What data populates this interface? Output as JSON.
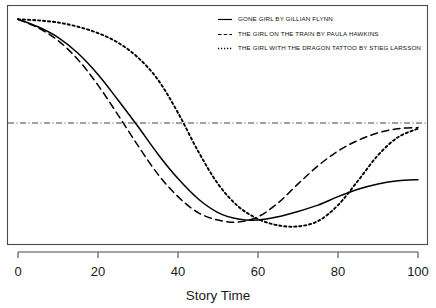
{
  "chart_data": {
    "type": "line",
    "title": "",
    "subtitle": "",
    "xlabel": "Story Time",
    "ylabel": "",
    "xlim": [
      0,
      100
    ],
    "ylim": [
      -1.05,
      1.05
    ],
    "xticks": [
      "0",
      "20",
      "40",
      "60",
      "80",
      "100"
    ],
    "xtick_values": [
      0,
      20,
      40,
      60,
      80,
      100
    ],
    "yticks": [],
    "grid": false,
    "legend_position": "top-right",
    "annotations": [
      {
        "name": "zero-reference-line",
        "style": "dash-dot",
        "orientation": "horizontal",
        "y_value": 0
      }
    ],
    "x": [
      0,
      5,
      10,
      15,
      20,
      25,
      30,
      35,
      40,
      45,
      50,
      55,
      60,
      65,
      70,
      75,
      80,
      85,
      90,
      95,
      100
    ],
    "series": [
      {
        "name": "GONE GIRL BY GILLIAN FLYNN",
        "short_name": "Gone Girl",
        "author": "Gillian Flynn",
        "style": "solid",
        "color": "#000000",
        "values": [
          1.0,
          0.93,
          0.83,
          0.68,
          0.48,
          0.24,
          -0.01,
          -0.27,
          -0.5,
          -0.69,
          -0.82,
          -0.88,
          -0.89,
          -0.86,
          -0.81,
          -0.75,
          -0.67,
          -0.6,
          -0.55,
          -0.52,
          -0.51
        ]
      },
      {
        "name": "THE GIRL ON THE TRAIN BY PAULA HAWKINS",
        "short_name": "The Girl on the Train",
        "author": "Paula Hawkins",
        "style": "dashed",
        "color": "#000000",
        "values": [
          1.0,
          0.92,
          0.8,
          0.62,
          0.38,
          0.1,
          -0.19,
          -0.46,
          -0.67,
          -0.82,
          -0.89,
          -0.91,
          -0.86,
          -0.73,
          -0.55,
          -0.38,
          -0.24,
          -0.14,
          -0.07,
          -0.03,
          -0.02
        ]
      },
      {
        "name": "THE GIRL WITH THE DRAGON TATTOO BY STIEG LARSSON",
        "short_name": "The Girl with the Dragon Tattoo",
        "author": "Stieg Larsson",
        "style": "dotted",
        "color": "#000000",
        "values": [
          1.0,
          0.99,
          0.97,
          0.93,
          0.87,
          0.78,
          0.64,
          0.43,
          0.12,
          -0.24,
          -0.55,
          -0.76,
          -0.88,
          -0.94,
          -0.95,
          -0.9,
          -0.75,
          -0.52,
          -0.28,
          -0.11,
          -0.03
        ]
      }
    ],
    "legend": [
      {
        "label": "GONE GIRL BY GILLIAN FLYNN",
        "style": "solid"
      },
      {
        "label": "THE GIRL ON THE TRAIN BY PAULA HAWKINS",
        "style": "dashed"
      },
      {
        "label": "THE GIRL WITH THE DRAGON TATTOO BY STIEG LARSSON",
        "style": "dotted"
      }
    ]
  }
}
